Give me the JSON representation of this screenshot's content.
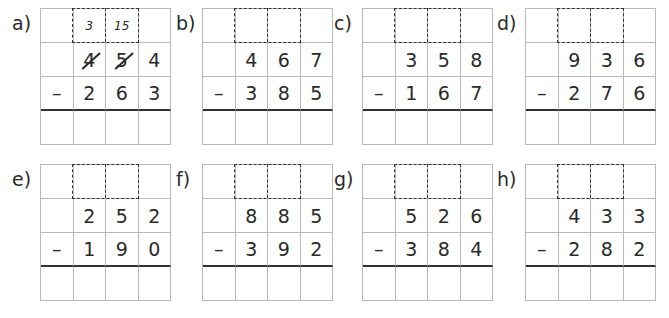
{
  "worksheet": {
    "problems": [
      {
        "label": "a)",
        "carry": [
          "",
          "3",
          "15",
          ""
        ],
        "top": [
          "",
          "4",
          "5",
          "4"
        ],
        "bottom": [
          "–",
          "2",
          "6",
          "3"
        ],
        "crossed": [
          false,
          true,
          true,
          false
        ],
        "result": [
          "",
          "",
          "",
          ""
        ]
      },
      {
        "label": "b)",
        "carry": [
          "",
          "",
          "",
          ""
        ],
        "top": [
          "",
          "4",
          "6",
          "7"
        ],
        "bottom": [
          "–",
          "3",
          "8",
          "5"
        ],
        "crossed": [
          false,
          false,
          false,
          false
        ],
        "result": [
          "",
          "",
          "",
          ""
        ]
      },
      {
        "label": "c)",
        "carry": [
          "",
          "",
          "",
          ""
        ],
        "top": [
          "",
          "3",
          "5",
          "8"
        ],
        "bottom": [
          "–",
          "1",
          "6",
          "7"
        ],
        "crossed": [
          false,
          false,
          false,
          false
        ],
        "result": [
          "",
          "",
          "",
          ""
        ]
      },
      {
        "label": "d)",
        "carry": [
          "",
          "",
          "",
          ""
        ],
        "top": [
          "",
          "9",
          "3",
          "6"
        ],
        "bottom": [
          "–",
          "2",
          "7",
          "6"
        ],
        "crossed": [
          false,
          false,
          false,
          false
        ],
        "result": [
          "",
          "",
          "",
          ""
        ]
      },
      {
        "label": "e)",
        "carry": [
          "",
          "",
          "",
          ""
        ],
        "top": [
          "",
          "2",
          "5",
          "2"
        ],
        "bottom": [
          "–",
          "1",
          "9",
          "0"
        ],
        "crossed": [
          false,
          false,
          false,
          false
        ],
        "result": [
          "",
          "",
          "",
          ""
        ]
      },
      {
        "label": "f)",
        "carry": [
          "",
          "",
          "",
          ""
        ],
        "top": [
          "",
          "8",
          "8",
          "5"
        ],
        "bottom": [
          "–",
          "3",
          "9",
          "2"
        ],
        "crossed": [
          false,
          false,
          false,
          false
        ],
        "result": [
          "",
          "",
          "",
          ""
        ]
      },
      {
        "label": "g)",
        "carry": [
          "",
          "",
          "",
          ""
        ],
        "top": [
          "",
          "5",
          "2",
          "6"
        ],
        "bottom": [
          "–",
          "3",
          "8",
          "4"
        ],
        "crossed": [
          false,
          false,
          false,
          false
        ],
        "result": [
          "",
          "",
          "",
          ""
        ]
      },
      {
        "label": "h)",
        "carry": [
          "",
          "",
          "",
          ""
        ],
        "top": [
          "",
          "4",
          "3",
          "3"
        ],
        "bottom": [
          "–",
          "2",
          "8",
          "2"
        ],
        "crossed": [
          false,
          false,
          false,
          false
        ],
        "result": [
          "",
          "",
          "",
          ""
        ]
      }
    ]
  }
}
